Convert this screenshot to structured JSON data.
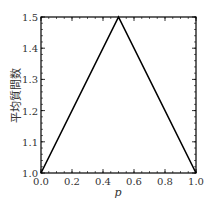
{
  "chart_data": {
    "type": "line",
    "title": "",
    "xlabel": "p",
    "ylabel": "平均質問数",
    "x": [
      0.0,
      0.5,
      1.0
    ],
    "series": [
      {
        "name": "",
        "values": [
          1.0,
          1.5,
          1.0
        ],
        "color": "#000000"
      }
    ],
    "xlim": [
      0.0,
      1.0
    ],
    "ylim": [
      1.0,
      1.5
    ],
    "xticks": [
      "0.0",
      "0.2",
      "0.4",
      "0.6",
      "0.8",
      "1.0"
    ],
    "yticks": [
      "1.0",
      "1.1",
      "1.2",
      "1.3",
      "1.4",
      "1.5"
    ],
    "grid": false,
    "legend": null
  }
}
